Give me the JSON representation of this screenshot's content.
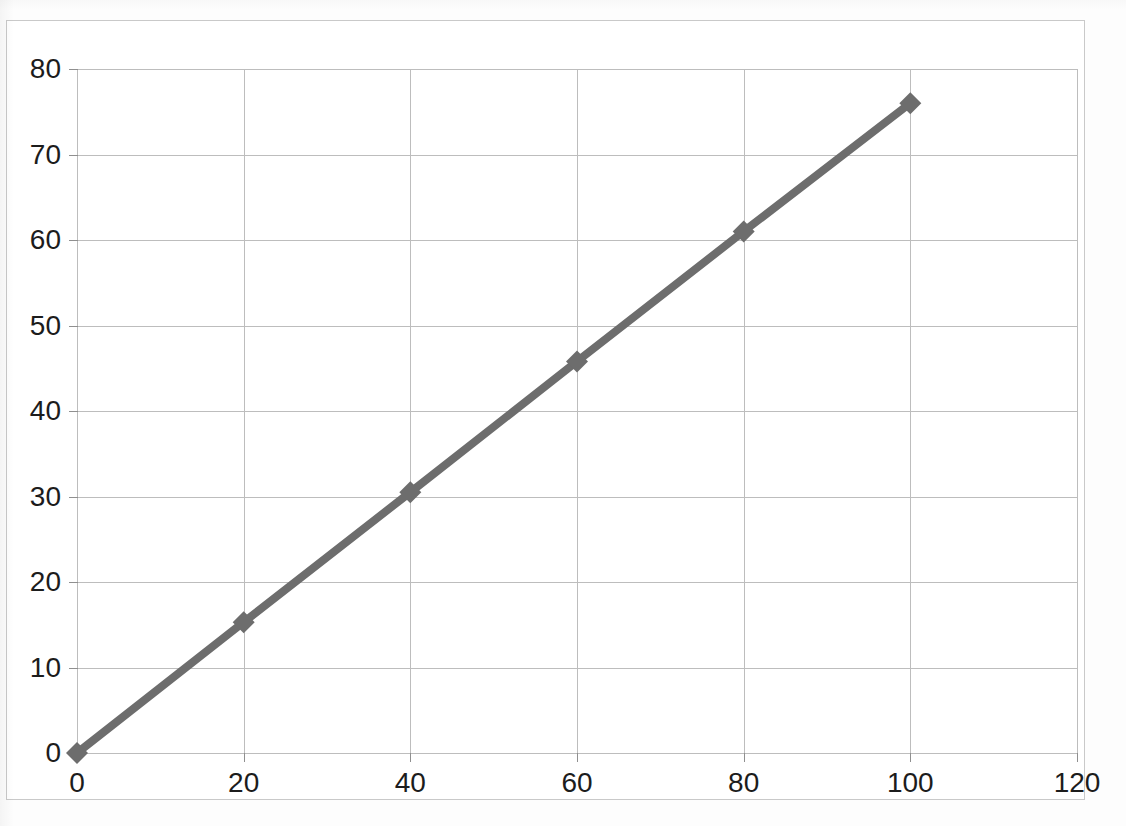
{
  "chart_data": {
    "type": "line",
    "title": "",
    "subtitle": "",
    "xlabel": "",
    "ylabel": "",
    "x": [
      0,
      20,
      40,
      60,
      80,
      100
    ],
    "series": [
      {
        "name": "Series 1",
        "values": [
          0,
          15.3,
          30.5,
          45.8,
          61.0,
          76.0
        ],
        "color": "#6d6d6d",
        "marker": "diamond",
        "line_width": 8
      }
    ],
    "xlim": [
      0,
      120
    ],
    "ylim": [
      0,
      80
    ],
    "xticks": [
      0,
      20,
      40,
      60,
      80,
      100,
      120
    ],
    "yticks": [
      0,
      10,
      20,
      30,
      40,
      50,
      60,
      70,
      80
    ],
    "xtick_labels": [
      "0",
      "20",
      "40",
      "60",
      "80",
      "100",
      "120"
    ],
    "ytick_labels": [
      "0",
      "10",
      "20",
      "30",
      "40",
      "50",
      "60",
      "70",
      "80"
    ],
    "grid": {
      "horizontal": true,
      "vertical": true,
      "color": "#bdbdbd"
    },
    "legend": {
      "visible": false,
      "position": "none",
      "entries": []
    },
    "annotations": [],
    "plot_background": "#ffffff",
    "frame_color": "#c9c9c9"
  }
}
